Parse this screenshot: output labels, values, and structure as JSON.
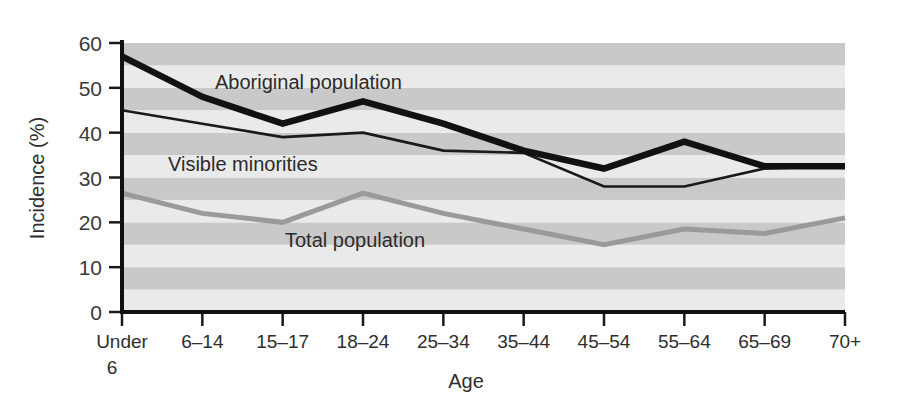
{
  "chart_data": {
    "type": "line",
    "title": "",
    "xlabel": "Age",
    "ylabel": "Incidence (%)",
    "ylim": [
      0,
      60
    ],
    "ytick_step": 10,
    "yticks": [
      "0",
      "10",
      "20",
      "30",
      "40",
      "50",
      "60"
    ],
    "grid": "horizontal alternating gray bands every 5 units",
    "legend_position": "inline labels on plot",
    "categories": [
      "Under 6",
      "6–14",
      "15–17",
      "18–24",
      "25–34",
      "35–44",
      "45–54",
      "55–64",
      "65–69",
      "70+"
    ],
    "series": [
      {
        "name": "Aboriginal population",
        "color": "#111111",
        "style": "thick-black",
        "values": [
          57,
          48,
          42,
          47,
          42,
          36,
          32,
          38,
          32.5,
          32.5
        ]
      },
      {
        "name": "Visible minorities",
        "color": "#1a1a1a",
        "style": "thin-black",
        "values": [
          45,
          42,
          39,
          40,
          36,
          35.5,
          28,
          28,
          32,
          32.5
        ]
      },
      {
        "name": "Total population",
        "color": "#9a9a9a",
        "style": "medium-gray",
        "values": [
          26.5,
          22,
          20,
          26.5,
          22,
          18.5,
          15,
          18.5,
          17.5,
          21
        ]
      }
    ],
    "annotations": [
      {
        "text": "Aboriginal population",
        "x": 215,
        "y": 89
      },
      {
        "text": "Visible minorities",
        "x": 168,
        "y": 171
      },
      {
        "text": "Total population",
        "x": 285,
        "y": 247
      }
    ]
  },
  "axis": {
    "y_title": "Incidence (%)",
    "x_title": "Age",
    "y_tick_labels": [
      "60",
      "50",
      "40",
      "30",
      "20",
      "10",
      "0"
    ]
  },
  "colors": {
    "band_light": "#eaeaea",
    "band_dark": "#c9c9c9",
    "axis": "#1a1a1a",
    "aboriginal": "#111111",
    "visible_minorities": "#1a1a1a",
    "total": "#9a9a9a",
    "background": "#ffffff"
  }
}
